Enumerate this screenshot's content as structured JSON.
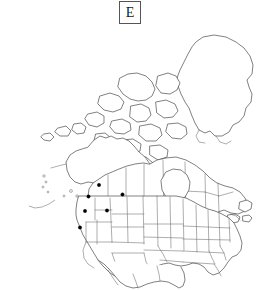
{
  "figure": {
    "panel_label": "E",
    "type": "distribution-map",
    "region": "North America",
    "background_color": "#ffffff",
    "outline_color": "#4a4a4a",
    "subdivision_color": "#6b6b6b",
    "marker_color": "#000000"
  },
  "map": {
    "projection_note": "North America with Alaska, Canada, Greenland, continental United States and northern Mexico",
    "landmasses": [
      "Alaska",
      "Aleutian Islands",
      "Canada",
      "Canadian Arctic Archipelago",
      "Greenland",
      "Continental United States",
      "Northern Mexico"
    ],
    "marker_count": 6,
    "markers": [
      {
        "label": "record-1",
        "x": 99.0,
        "y": 185.0,
        "area": "Washington"
      },
      {
        "label": "record-2",
        "x": 88.5,
        "y": 196.5,
        "area": "Oregon"
      },
      {
        "label": "record-3",
        "x": 122.5,
        "y": 194.5,
        "area": "Montana-Wyoming"
      },
      {
        "label": "record-4",
        "x": 85.0,
        "y": 211.0,
        "area": "Nevada"
      },
      {
        "label": "record-5",
        "x": 107.0,
        "y": 210.5,
        "area": "Utah"
      },
      {
        "label": "record-6",
        "x": 80.0,
        "y": 227.5,
        "area": "California"
      }
    ]
  }
}
